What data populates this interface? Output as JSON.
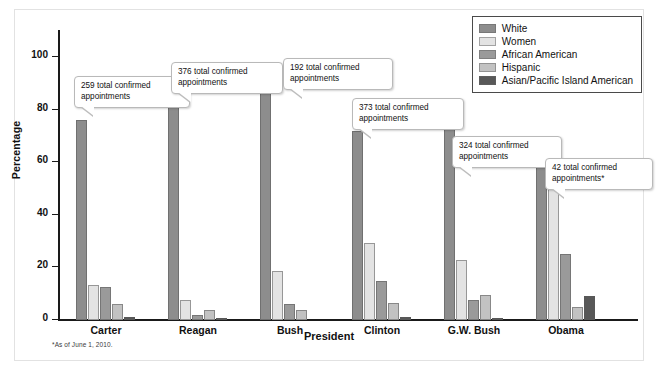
{
  "chart_data": {
    "type": "bar",
    "title": "",
    "xlabel": "President",
    "ylabel": "Percentage",
    "ylim": [
      0,
      110
    ],
    "yticks": [
      0,
      20,
      40,
      60,
      80,
      100
    ],
    "ytick_labels": [
      "0",
      "20",
      "40",
      "60",
      "80",
      "100"
    ],
    "grid": false,
    "legend_position": "top-right",
    "categories": [
      "Carter",
      "Reagan",
      "Bush",
      "Clinton",
      "G.W. Bush",
      "Obama"
    ],
    "series": [
      {
        "name": "White",
        "color": "#8d8d8d",
        "values": [
          76,
          88,
          87,
          72,
          81,
          60
        ]
      },
      {
        "name": "Women",
        "color": "#e3e3e3",
        "values": [
          13.5,
          7.5,
          18.5,
          29.5,
          23,
          50
        ]
      },
      {
        "name": "African American",
        "color": "#9a9a9a",
        "values": [
          12.5,
          2,
          6,
          15,
          7.5,
          25
        ]
      },
      {
        "name": "Hispanic",
        "color": "#c2c2c2",
        "values": [
          6,
          4,
          4,
          6.5,
          9.5,
          5
        ]
      },
      {
        "name": "Asian/Pacific Island American",
        "color": "#585858",
        "values": [
          1,
          0.8,
          0,
          1,
          0.8,
          9
        ]
      }
    ],
    "annotations": [
      {
        "text": "259 total confirmed appointments",
        "category": "Carter"
      },
      {
        "text": "376 total confirmed appointments",
        "category": "Reagan"
      },
      {
        "text": "192 total confirmed appointments",
        "category": "Bush"
      },
      {
        "text": "373 total confirmed appointments",
        "category": "Clinton"
      },
      {
        "text": "324 total confirmed appointments",
        "category": "G.W. Bush"
      },
      {
        "text": "42 total confirmed appointments*",
        "category": "Obama"
      }
    ],
    "footnote": "*As of June 1, 2010."
  },
  "axis": {
    "y_label": "Percentage",
    "x_label": "President",
    "ticks": [
      "100",
      "80",
      "60",
      "40",
      "20",
      "0"
    ]
  },
  "legend": {
    "items": [
      {
        "label": "White"
      },
      {
        "label": "Women"
      },
      {
        "label": "African American"
      },
      {
        "label": "Hispanic"
      },
      {
        "label": "Asian/Pacific Island American"
      }
    ]
  },
  "groups": [
    {
      "label": "Carter"
    },
    {
      "label": "Reagan"
    },
    {
      "label": "Bush"
    },
    {
      "label": "Clinton"
    },
    {
      "label": "G.W. Bush"
    },
    {
      "label": "Obama"
    }
  ],
  "callouts": [
    {
      "line1": "259 total confirmed",
      "line2": "appointments"
    },
    {
      "line1": "376 total confirmed",
      "line2": "appointments"
    },
    {
      "line1": "192 total confirmed",
      "line2": "appointments"
    },
    {
      "line1": "373 total confirmed",
      "line2": "appointments"
    },
    {
      "line1": "324 total confirmed",
      "line2": "appointments"
    },
    {
      "line1": "42 total confirmed",
      "line2": "appointments*"
    }
  ],
  "footnote": "*As of June 1, 2010."
}
